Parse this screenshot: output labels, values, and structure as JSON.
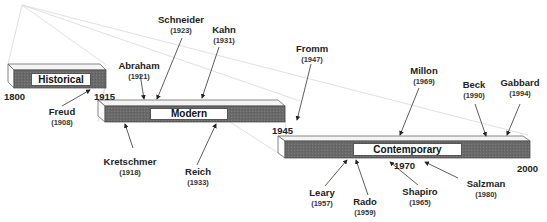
{
  "periods": [
    {
      "label": "Historical",
      "start": "1800",
      "end": "1915"
    },
    {
      "label": "Modern",
      "start": "1915",
      "end": "1945"
    },
    {
      "label": "Contemporary",
      "start": "1945",
      "end": "2000",
      "mid_tick": "1970"
    }
  ],
  "figures": [
    {
      "name": "Freud",
      "year": "(1908)"
    },
    {
      "name": "Abraham",
      "year": "(1921)"
    },
    {
      "name": "Schneider",
      "year": "(1923)"
    },
    {
      "name": "Kahn",
      "year": "(1931)"
    },
    {
      "name": "Kretschmer",
      "year": "(1918)"
    },
    {
      "name": "Reich",
      "year": "(1933)"
    },
    {
      "name": "Fromm",
      "year": "(1947)"
    },
    {
      "name": "Millon",
      "year": "(1969)"
    },
    {
      "name": "Beck",
      "year": "(1990)"
    },
    {
      "name": "Gabbard",
      "year": "(1994)"
    },
    {
      "name": "Leary",
      "year": "(1957)"
    },
    {
      "name": "Rado",
      "year": "(1959)"
    },
    {
      "name": "Shapiro",
      "year": "(1965)"
    },
    {
      "name": "Salzman",
      "year": "(1980)"
    }
  ],
  "colors": {
    "bar_fill": "#6e6e6e",
    "bar_top": "#f2f2f2",
    "bar_side": "#fafafa",
    "outline": "#444444",
    "text": "#222222"
  }
}
